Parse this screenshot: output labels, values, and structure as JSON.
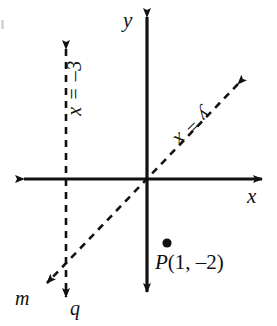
{
  "figure": {
    "background_color": "#ffffff",
    "stroke_color": "#111111",
    "width": 277,
    "height": 326
  },
  "axes": {
    "origin": {
      "x": 147,
      "y": 179
    },
    "x_axis": {
      "label": "x",
      "from": {
        "x": 20,
        "y": 179
      },
      "to": {
        "x": 266,
        "y": 179
      },
      "arrows": "both"
    },
    "y_axis": {
      "label": "y",
      "from": {
        "x": 147,
        "y": 12
      },
      "to": {
        "x": 147,
        "y": 297
      },
      "arrows": "both"
    }
  },
  "lines": [
    {
      "name": "q",
      "equation": "x = –3",
      "style": "dashed",
      "arrows": "both",
      "label_rotation_deg": -90,
      "from": {
        "x": 66,
        "y": 43
      },
      "to": {
        "x": 66,
        "y": 303
      }
    },
    {
      "name": "m",
      "equation": "y = x",
      "style": "dashed",
      "arrows": "both",
      "label_rotation_deg": -45,
      "from": {
        "x": 243,
        "y": 79
      },
      "to": {
        "x": 42,
        "y": 288
      }
    }
  ],
  "points": [
    {
      "name": "P",
      "label": "P(1, –2)",
      "label_prefix": "P",
      "label_coords": "(1, –2)",
      "dot": {
        "x": 167,
        "y": 243
      },
      "coordinates": {
        "x": 1,
        "y": -2
      }
    }
  ],
  "line_name_labels": {
    "m": "m",
    "q": "q"
  }
}
